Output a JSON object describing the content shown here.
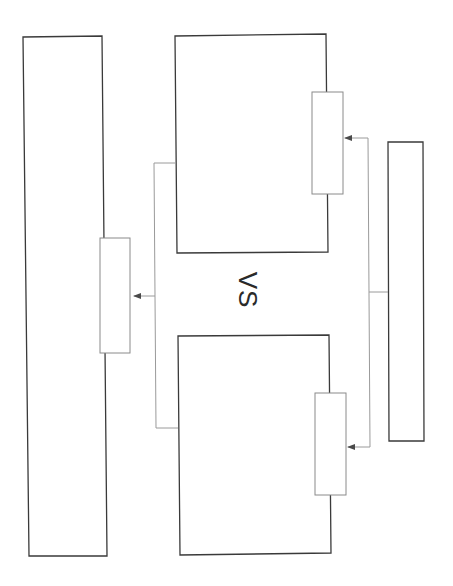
{
  "diagram": {
    "vs_label": "VS",
    "colors": {
      "box_stroke": "#3a3a3a",
      "small_box_stroke": "#8a8a8a",
      "connector": "#9a9a9a",
      "arrow": "#4a4a4a",
      "background": "#ffffff"
    },
    "boxes": [
      {
        "id": "left-tall-box",
        "x": 24,
        "y": 37,
        "w": 83,
        "h": 519
      },
      {
        "id": "upper-middle-box",
        "x": 175,
        "y": 35,
        "w": 153,
        "h": 218
      },
      {
        "id": "lower-middle-box",
        "x": 177,
        "y": 335,
        "w": 154,
        "h": 219
      },
      {
        "id": "right-narrow-box",
        "x": 388,
        "y": 142,
        "w": 36,
        "h": 299
      }
    ],
    "small_boxes": [
      {
        "id": "left-port",
        "x": 100,
        "y": 238,
        "w": 30,
        "h": 115
      },
      {
        "id": "upper-port",
        "x": 312,
        "y": 92,
        "w": 31,
        "h": 102
      },
      {
        "id": "lower-port",
        "x": 315,
        "y": 393,
        "w": 31,
        "h": 102
      }
    ]
  }
}
